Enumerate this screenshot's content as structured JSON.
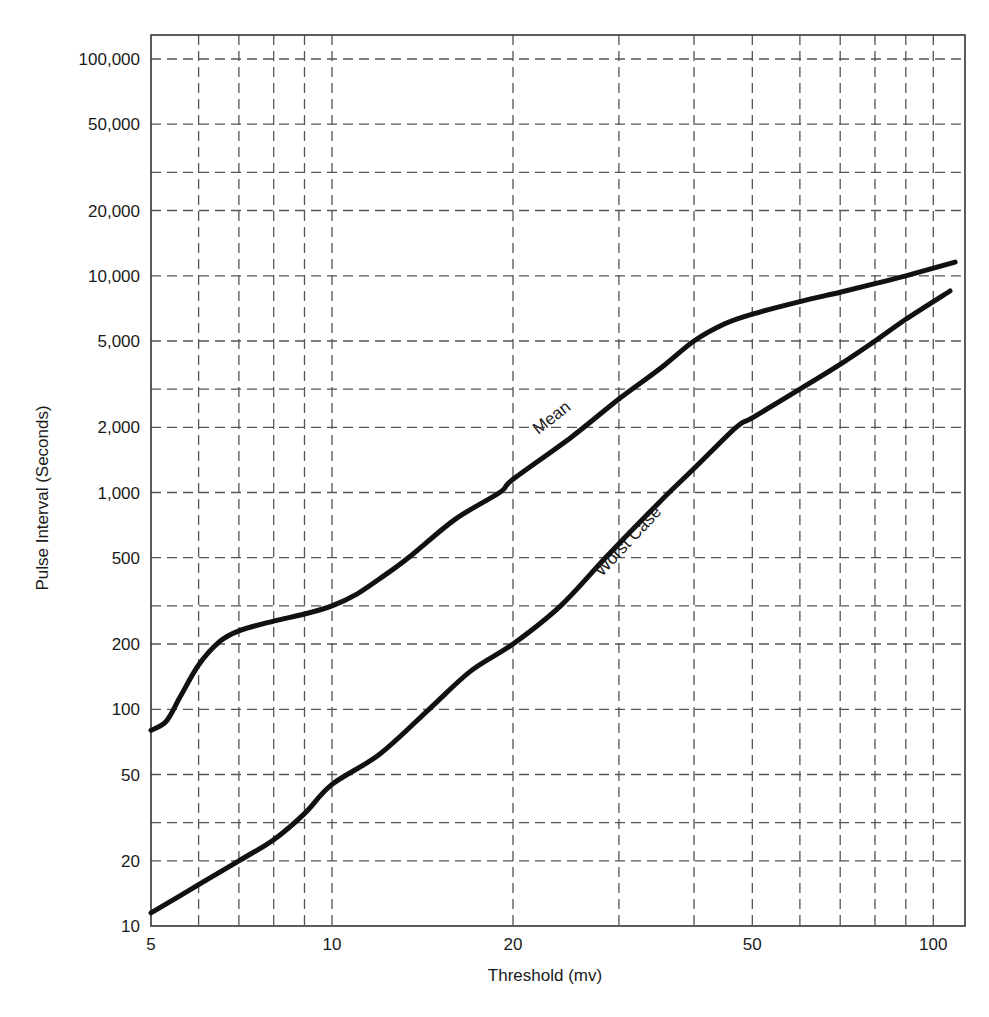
{
  "chart_data": {
    "type": "line",
    "title": "",
    "xlabel": "Threshold (mv)",
    "ylabel": "Pulse Interval (Seconds)",
    "xscale": "log",
    "yscale": "log",
    "xlim": [
      5,
      113
    ],
    "ylim": [
      10,
      129000
    ],
    "grid": true,
    "legend": "inline curve labels",
    "x_ticks": [
      {
        "value": 5,
        "label": "5"
      },
      {
        "value": 10,
        "label": "10"
      },
      {
        "value": 20,
        "label": "20"
      },
      {
        "value": 50,
        "label": "50"
      },
      {
        "value": 100,
        "label": "100"
      }
    ],
    "x_gridlines": [
      6,
      7,
      8,
      9,
      10,
      20,
      30,
      40,
      50,
      60,
      70,
      80,
      90,
      100
    ],
    "y_ticks": [
      {
        "value": 10,
        "label": "10"
      },
      {
        "value": 20,
        "label": "20"
      },
      {
        "value": 50,
        "label": "50"
      },
      {
        "value": 100,
        "label": "100"
      },
      {
        "value": 200,
        "label": "200"
      },
      {
        "value": 500,
        "label": "500"
      },
      {
        "value": 1000,
        "label": "1,000"
      },
      {
        "value": 2000,
        "label": "2,000"
      },
      {
        "value": 5000,
        "label": "5,000"
      },
      {
        "value": 10000,
        "label": "10,000"
      },
      {
        "value": 20000,
        "label": "20,000"
      },
      {
        "value": 50000,
        "label": "50,000"
      },
      {
        "value": 100000,
        "label": "100,000"
      }
    ],
    "y_gridlines": [
      20,
      30,
      50,
      100,
      200,
      300,
      500,
      1000,
      2000,
      3000,
      5000,
      10000,
      20000,
      30000,
      50000,
      100000
    ],
    "series": [
      {
        "name": "Mean",
        "label_pos": {
          "x": 555,
          "y": 422,
          "rotate": -38
        },
        "points": [
          [
            5,
            80
          ],
          [
            5.3,
            88
          ],
          [
            5.6,
            115
          ],
          [
            6,
            160
          ],
          [
            6.5,
            205
          ],
          [
            7,
            230
          ],
          [
            8,
            255
          ],
          [
            9,
            275
          ],
          [
            10,
            300
          ],
          [
            11,
            340
          ],
          [
            12,
            400
          ],
          [
            13.4,
            500
          ],
          [
            16,
            750
          ],
          [
            19,
            1000
          ],
          [
            20,
            1150
          ],
          [
            25,
            1800
          ],
          [
            30,
            2700
          ],
          [
            35,
            3700
          ],
          [
            40,
            5000
          ],
          [
            45,
            6000
          ],
          [
            50,
            6650
          ],
          [
            60,
            7600
          ],
          [
            70,
            8400
          ],
          [
            80,
            9200
          ],
          [
            90,
            10000
          ],
          [
            108.7,
            11560
          ]
        ]
      },
      {
        "name": "Worst Case",
        "label_pos": {
          "x": 632,
          "y": 545,
          "rotate": -47
        },
        "points": [
          [
            5,
            11.5
          ],
          [
            6,
            15.5
          ],
          [
            7,
            20
          ],
          [
            8,
            25
          ],
          [
            9,
            33
          ],
          [
            10,
            45
          ],
          [
            12,
            62
          ],
          [
            14.5,
            100
          ],
          [
            17,
            150
          ],
          [
            20,
            200
          ],
          [
            24,
            300
          ],
          [
            28.5,
            500
          ],
          [
            35,
            900
          ],
          [
            40,
            1290
          ],
          [
            47,
            2000
          ],
          [
            50,
            2210
          ],
          [
            60,
            3000
          ],
          [
            70,
            3900
          ],
          [
            80,
            5000
          ],
          [
            90,
            6300
          ],
          [
            106.6,
            8500
          ]
        ]
      }
    ]
  }
}
